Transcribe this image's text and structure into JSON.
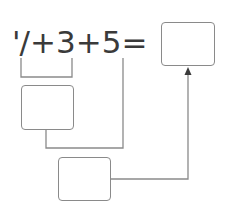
{
  "equation": {
    "term1": "'/",
    "op1": "+",
    "term2": "3",
    "op2": "+",
    "term3": "5",
    "equals": "="
  },
  "boxes": {
    "result": {
      "value": ""
    },
    "step1": {
      "value": ""
    },
    "step2": {
      "value": ""
    }
  },
  "colors": {
    "line": "#8a8a8a",
    "text": "#3a3a3a"
  }
}
